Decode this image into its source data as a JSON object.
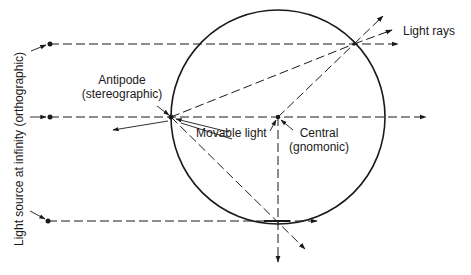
{
  "labels": {
    "light_rays": "Light rays",
    "antipode_line1": "Antipode",
    "antipode_line2": "(stereographic)",
    "movable_light": "Movable light",
    "central_line1": "Central",
    "central_line2": "(gnomonic)",
    "light_source": "Light source at infinity (orthographic)"
  },
  "colors": {
    "ink": "#1a1a1a",
    "background": "#ffffff"
  },
  "geometry": {
    "circle": {
      "cx": 278,
      "cy": 117,
      "r": 107
    },
    "points": {
      "antipode": [
        171,
        117
      ],
      "central": [
        278,
        117
      ],
      "tangent_bottom": [
        278,
        221
      ],
      "projection_point": [
        354,
        44
      ]
    }
  }
}
